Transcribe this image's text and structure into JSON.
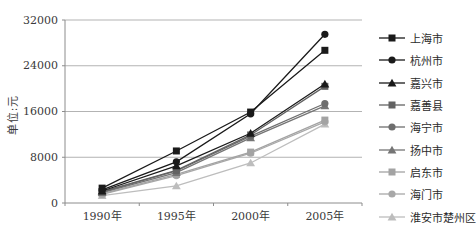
{
  "chart_data": {
    "type": "line",
    "title": "",
    "xlabel": "",
    "ylabel": "单位:元",
    "categories": [
      "1990年",
      "1995年",
      "2000年",
      "2005年"
    ],
    "y_ticks": [
      0,
      8000,
      16000,
      24000,
      32000
    ],
    "ylim": [
      0,
      32000
    ],
    "grid": true,
    "legend_position": "right",
    "axis_colors": {
      "grid": "#b3b3b3",
      "axis": "#8c8c8c",
      "tick_label": "#3a3a3a"
    },
    "series": [
      {
        "name": "上海市",
        "marker": "square",
        "color": "#1a1a1a",
        "values": [
          2600,
          9100,
          15900,
          26700
        ]
      },
      {
        "name": "杭州市",
        "marker": "circle",
        "color": "#1a1a1a",
        "values": [
          2300,
          7200,
          15600,
          29500
        ]
      },
      {
        "name": "嘉兴市",
        "marker": "triangle",
        "color": "#1a1a1a",
        "values": [
          2100,
          6500,
          12200,
          20800
        ]
      },
      {
        "name": "嘉善县",
        "marker": "square",
        "color": "#636363",
        "values": [
          2000,
          5700,
          11900,
          20400
        ]
      },
      {
        "name": "海宁市",
        "marker": "circle",
        "color": "#6e6e6e",
        "values": [
          1900,
          5600,
          11700,
          17400
        ]
      },
      {
        "name": "扬中市",
        "marker": "triangle",
        "color": "#757575",
        "values": [
          1800,
          5300,
          11400,
          17000
        ]
      },
      {
        "name": "启东市",
        "marker": "square",
        "color": "#a3a3a3",
        "values": [
          1600,
          5000,
          8900,
          14500
        ]
      },
      {
        "name": "海门市",
        "marker": "circle",
        "color": "#a8a8a8",
        "values": [
          1500,
          4800,
          8700,
          14200
        ]
      },
      {
        "name": "淮安市楚州区",
        "marker": "triangle",
        "color": "#bdbdbd",
        "values": [
          1300,
          3000,
          7000,
          13800
        ]
      }
    ]
  }
}
